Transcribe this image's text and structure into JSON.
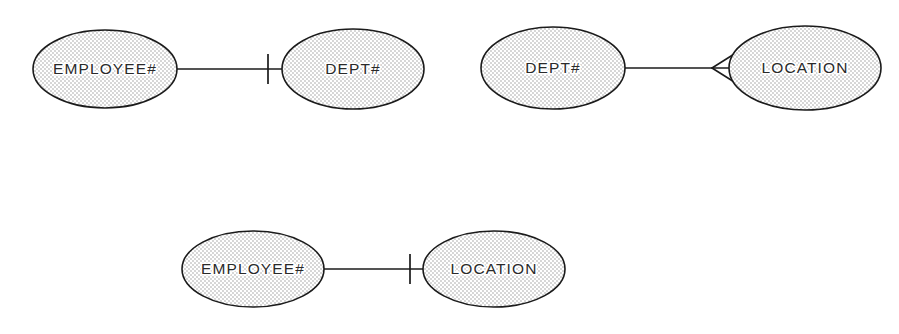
{
  "diagram": {
    "background_color": "#ffffff",
    "line_color": "#1b1b1b",
    "text_color": "#2a2a2a",
    "fill_pattern": "stipple-dots",
    "fill_dot_color": "#9a9a9a",
    "width": 899,
    "height": 334
  },
  "relationships": [
    {
      "id": "rel-employee-dept",
      "left": {
        "label": "EMPLOYEE#",
        "cx": 105,
        "cy": 69,
        "rx": 72,
        "ry": 39
      },
      "right": {
        "label": "DEPT#",
        "cx": 353,
        "cy": 69,
        "rx": 71,
        "ry": 40
      },
      "connector": {
        "x1": 177,
        "x2": 282,
        "y": 69
      },
      "marker": {
        "type": "one",
        "symbol": "tick",
        "x": 268,
        "y": 69,
        "half_height": 15
      }
    },
    {
      "id": "rel-dept-location",
      "left": {
        "label": "DEPT#",
        "cx": 553,
        "cy": 68,
        "rx": 72,
        "ry": 41
      },
      "right": {
        "label": "LOCATION",
        "cx": 805,
        "cy": 68,
        "rx": 76,
        "ry": 42
      },
      "connector": {
        "x1": 625,
        "x2": 730,
        "y": 68
      },
      "marker": {
        "type": "many",
        "symbol": "crows-foot",
        "apex_x": 712,
        "base_x": 737,
        "y": 68,
        "spread": 17
      }
    },
    {
      "id": "rel-employee-location",
      "left": {
        "label": "EMPLOYEE#",
        "cx": 253,
        "cy": 269,
        "rx": 71,
        "ry": 38
      },
      "right": {
        "label": "LOCATION",
        "cx": 494,
        "cy": 269,
        "rx": 71,
        "ry": 38
      },
      "connector": {
        "x1": 324,
        "x2": 423,
        "y": 269
      },
      "marker": {
        "type": "one",
        "symbol": "tick",
        "x": 410,
        "y": 269,
        "half_height": 15
      }
    }
  ]
}
